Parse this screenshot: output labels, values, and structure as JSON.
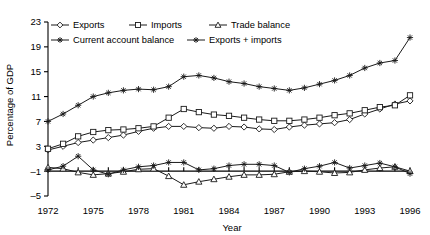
{
  "chart_data": {
    "type": "line",
    "title": "",
    "xlabel": "Year",
    "ylabel": "Percentage of GDP",
    "xlim": [
      1972,
      1996
    ],
    "ylim": [
      -5,
      23
    ],
    "yticks": [
      -5,
      -1,
      3,
      7,
      11,
      15,
      19,
      23
    ],
    "xticks": [
      1972,
      1975,
      1978,
      1981,
      1984,
      1987,
      1990,
      1993,
      1996
    ],
    "ytick_labels": [
      "-5",
      "-1",
      "3",
      "7",
      "11",
      "15",
      "19",
      "23"
    ],
    "xtick_labels": [
      "1972",
      "1975",
      "1978",
      "1981",
      "1984",
      "1987",
      "1990",
      "1993",
      "1996"
    ],
    "grid": false,
    "legend_position": "top-left",
    "x": [
      1972,
      1973,
      1974,
      1975,
      1976,
      1977,
      1978,
      1979,
      1980,
      1981,
      1982,
      1983,
      1984,
      1985,
      1986,
      1987,
      1988,
      1989,
      1990,
      1991,
      1992,
      1993,
      1994,
      1995,
      1996
    ],
    "series": [
      {
        "name": "Exports",
        "marker": "diamond",
        "values": [
          2.4,
          3.0,
          3.6,
          4.0,
          4.4,
          4.8,
          5.4,
          5.9,
          6.2,
          6.2,
          6.0,
          5.9,
          6.2,
          6.1,
          5.8,
          5.7,
          6.1,
          6.4,
          6.6,
          6.8,
          7.3,
          8.2,
          9.0,
          9.8,
          10.3
        ]
      },
      {
        "name": "Imports",
        "marker": "square",
        "values": [
          2.6,
          3.4,
          4.6,
          5.3,
          5.6,
          5.7,
          5.9,
          6.2,
          7.6,
          9.0,
          8.5,
          8.1,
          7.9,
          7.6,
          7.3,
          7.1,
          7.1,
          7.3,
          7.6,
          8.0,
          8.3,
          8.8,
          9.3,
          9.6,
          11.2
        ]
      },
      {
        "name": "Trade balance",
        "marker": "triangle",
        "values": [
          -0.4,
          -0.6,
          -1.2,
          -1.6,
          -1.4,
          -1.1,
          -0.7,
          -0.6,
          -1.8,
          -3.2,
          -2.7,
          -2.3,
          -1.9,
          -1.6,
          -1.6,
          -1.5,
          -1.1,
          -1.0,
          -1.1,
          -1.3,
          -1.2,
          -0.8,
          -0.5,
          -0.3,
          -1.0
        ]
      },
      {
        "name": "Current account balance",
        "marker": "star",
        "values": [
          -0.8,
          -0.2,
          1.4,
          -0.8,
          -1.5,
          -0.8,
          -0.3,
          -0.1,
          0.4,
          0.4,
          -0.8,
          -0.6,
          -0.1,
          0.1,
          0.1,
          -0.1,
          -1.2,
          -0.6,
          -0.2,
          0.4,
          -0.5,
          -0.1,
          0.3,
          -0.3,
          -1.4
        ]
      },
      {
        "name": "Exports + imports",
        "marker": "star",
        "values": [
          7.0,
          8.2,
          9.6,
          11.0,
          11.6,
          12.0,
          12.2,
          12.1,
          12.6,
          14.2,
          14.4,
          14.0,
          13.4,
          13.1,
          12.6,
          12.3,
          12.0,
          12.4,
          13.0,
          13.6,
          14.4,
          15.6,
          16.4,
          16.8,
          20.5
        ]
      }
    ]
  },
  "legend": {
    "items": [
      {
        "label": "Exports",
        "marker": "diamond"
      },
      {
        "label": "Imports",
        "marker": "square"
      },
      {
        "label": "Trade balance",
        "marker": "triangle"
      },
      {
        "label": "Current account balance",
        "marker": "star"
      },
      {
        "label": "Exports + imports",
        "marker": "star"
      }
    ]
  },
  "colors": {
    "line": "#1a1a1a",
    "marker_fill": "#ffffff",
    "background": "#ffffff"
  }
}
